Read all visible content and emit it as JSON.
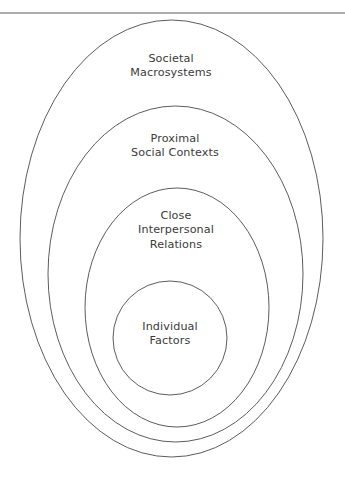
{
  "figure": {
    "background_color": "#ffffff",
    "stroke_color": "#4a4a4a",
    "text_color": "#3b3b3b",
    "top_rule": {
      "name": "top-horizontal-rule",
      "y": 13,
      "color": "#5a5a5a"
    }
  },
  "rings": [
    {
      "id": "societal-macrosystems",
      "level": 1,
      "shape": "ellipse",
      "lines": [
        "Societal",
        "Macrosystems"
      ],
      "label_line_1": "Societal",
      "label_line_2": "Macrosystems",
      "label_line_3": "",
      "cx": 171.5,
      "cy": 238.5,
      "rx": 151.5,
      "ry": 218.5,
      "label_x": 171,
      "label_y": 52
    },
    {
      "id": "proximal-social-contexts",
      "level": 2,
      "shape": "ellipse",
      "lines": [
        "Proximal",
        "Social Contexts"
      ],
      "label_line_1": "Proximal",
      "label_line_2": "Social Contexts",
      "label_line_3": "",
      "cx": 175.5,
      "cy": 274.0,
      "rx": 127.5,
      "ry": 168.0,
      "label_x": 175,
      "label_y": 132
    },
    {
      "id": "close-interpersonal-relations",
      "level": 3,
      "shape": "ellipse",
      "lines": [
        "Close",
        "Interpersonal",
        "Relations"
      ],
      "label_line_1": "Close",
      "label_line_2": "Interpersonal",
      "label_line_3": "Relations",
      "cx": 177.0,
      "cy": 307.5,
      "rx": 92.0,
      "ry": 119.5,
      "label_x": 176,
      "label_y": 209
    },
    {
      "id": "individual-factors",
      "level": 4,
      "shape": "circle",
      "lines": [
        "Individual",
        "Factors"
      ],
      "label_line_1": "Individual",
      "label_line_2": "Factors",
      "label_line_3": "",
      "cx": 170.0,
      "cy": 338.0,
      "rx": 57.0,
      "ry": 57.0,
      "label_x": 170,
      "label_y": 320
    }
  ]
}
